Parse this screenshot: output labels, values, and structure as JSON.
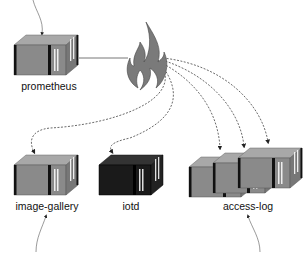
{
  "diagram": {
    "type": "service-architecture",
    "nodes": [
      {
        "id": "prometheus",
        "label": "prometheus",
        "icon": "server-container-gray"
      },
      {
        "id": "firewall",
        "label": "",
        "icon": "fire-icon"
      },
      {
        "id": "image-gallery",
        "label": "image-gallery",
        "icon": "server-container-gray"
      },
      {
        "id": "iotd",
        "label": "iotd",
        "icon": "server-container-black"
      },
      {
        "id": "access-log",
        "label": "access-log",
        "icon": "server-container-gray-x3"
      }
    ],
    "edges": [
      {
        "from": "prometheus",
        "to": "firewall",
        "style": "solid"
      },
      {
        "from": "firewall",
        "to": "image-gallery",
        "style": "dashed-arrow"
      },
      {
        "from": "firewall",
        "to": "iotd",
        "style": "dashed-arrow"
      },
      {
        "from": "firewall",
        "to": "access-log",
        "style": "dashed-arrow",
        "count": 3
      }
    ],
    "incoming_arrows": [
      "prometheus",
      "image-gallery",
      "access-log"
    ],
    "colors": {
      "container_gray": "#8a8a8a",
      "container_dark": "#1a1a1a",
      "flame": "#7a7a7a",
      "line": "#444444"
    }
  }
}
